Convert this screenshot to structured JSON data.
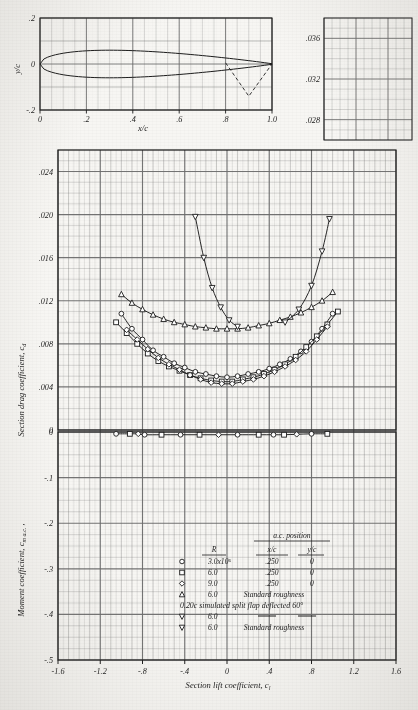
{
  "figure": {
    "style": "naca-airfoil-data-sheet",
    "paper_color": "#f7f6f3",
    "ink_color": "#1b1b1b",
    "grid_color": "#6d6d6d"
  },
  "profile_panel": {
    "name": "airfoil-section-profile",
    "xlabel": "x/c",
    "ylabel": "y/c",
    "xticks": [
      "0",
      ".2",
      ".4",
      ".6",
      ".8",
      "1.0"
    ],
    "xtick_values": [
      0,
      0.2,
      0.4,
      0.6,
      0.8,
      1.0
    ],
    "yticks": [
      ".2",
      "0",
      "-.2"
    ],
    "ytick_values": [
      0.2,
      0,
      -0.2
    ],
    "xlim": [
      0,
      1.0
    ],
    "ylim": [
      -0.2,
      0.2
    ],
    "thickness_ratio": 0.12,
    "flap_hinge_xc": 0.8,
    "flap_tip_xc": 0.9,
    "flap_tip_yc": -0.14
  },
  "corner_panel": {
    "name": "upper-right-grid-panel",
    "yticks": [
      ".036",
      ".032",
      ".028"
    ],
    "ytick_values": [
      0.036,
      0.032,
      0.028
    ]
  },
  "chart_data": {
    "type": "line",
    "title": "",
    "xlabel": "Section lift coefficient, c_l",
    "ylabel_top": "Section drag coefficient, c_d",
    "ylabel_bottom": "Moment coefficient, c_m a.c.",
    "xlim": [
      -1.6,
      1.6
    ],
    "xticks": [
      "-1.6",
      "-1.2",
      "-.8",
      "-.4",
      "0",
      ".4",
      ".8",
      "1.2",
      "1.6"
    ],
    "xtick_values": [
      -1.6,
      -1.2,
      -0.8,
      -0.4,
      0,
      0.4,
      0.8,
      1.2,
      1.6
    ],
    "drag_ylim": [
      0,
      0.026
    ],
    "drag_yticks": [
      ".024",
      ".020",
      ".016",
      ".012",
      ".008",
      ".004",
      "0"
    ],
    "drag_ytick_values": [
      0.024,
      0.02,
      0.016,
      0.012,
      0.008,
      0.004,
      0
    ],
    "moment_ylim": [
      -0.5,
      0.0
    ],
    "moment_yticks": [
      "0",
      "-.1",
      "-.2",
      "-.3",
      "-.4",
      "-.5"
    ],
    "moment_ytick_values": [
      0,
      -0.1,
      -0.2,
      -0.3,
      -0.4,
      -0.5
    ],
    "grid": true,
    "minor_step_x": 0.1,
    "minor_step_cd": 0.001,
    "minor_step_cm": 0.025,
    "series": [
      {
        "name": "R = 3.0x10^6 drag polar",
        "marker": "circle",
        "panel": "drag",
        "x": [
          -1.0,
          -0.9,
          -0.8,
          -0.7,
          -0.6,
          -0.5,
          -0.4,
          -0.3,
          -0.2,
          -0.1,
          0.0,
          0.1,
          0.2,
          0.3,
          0.4,
          0.5,
          0.6,
          0.7,
          0.8,
          0.9,
          1.0
        ],
        "values": [
          0.0108,
          0.0094,
          0.0084,
          0.0074,
          0.0068,
          0.0062,
          0.0058,
          0.0054,
          0.0052,
          0.005,
          0.0049,
          0.005,
          0.0052,
          0.0054,
          0.0057,
          0.0061,
          0.0066,
          0.0073,
          0.0082,
          0.0094,
          0.0108
        ]
      },
      {
        "name": "R = 6.0x10^6 drag polar",
        "marker": "square",
        "panel": "drag",
        "x": [
          -1.05,
          -0.95,
          -0.85,
          -0.75,
          -0.65,
          -0.55,
          -0.45,
          -0.35,
          -0.25,
          -0.15,
          -0.05,
          0.05,
          0.15,
          0.25,
          0.35,
          0.45,
          0.55,
          0.65,
          0.75,
          0.85,
          0.95,
          1.05
        ],
        "values": [
          0.01,
          0.009,
          0.008,
          0.0071,
          0.0064,
          0.0059,
          0.0055,
          0.0051,
          0.0048,
          0.0046,
          0.0045,
          0.0045,
          0.0047,
          0.0049,
          0.0052,
          0.0056,
          0.0061,
          0.0068,
          0.0077,
          0.0087,
          0.0098,
          0.011
        ]
      },
      {
        "name": "R = 9.0x10^6 drag polar",
        "marker": "diamond",
        "panel": "drag",
        "x": [
          -0.95,
          -0.85,
          -0.75,
          -0.65,
          -0.55,
          -0.45,
          -0.35,
          -0.25,
          -0.15,
          -0.05,
          0.05,
          0.15,
          0.25,
          0.35,
          0.45,
          0.55,
          0.65,
          0.75,
          0.85,
          0.95
        ],
        "values": [
          0.0093,
          0.0084,
          0.0075,
          0.0067,
          0.0061,
          0.0056,
          0.0051,
          0.0047,
          0.0044,
          0.0043,
          0.0043,
          0.0045,
          0.0047,
          0.005,
          0.0054,
          0.0059,
          0.0065,
          0.0073,
          0.0084,
          0.0096
        ]
      },
      {
        "name": "R = 6.0x10^6 standard roughness drag polar",
        "marker": "triangle",
        "panel": "drag",
        "x": [
          -1.0,
          -0.9,
          -0.8,
          -0.7,
          -0.6,
          -0.5,
          -0.4,
          -0.3,
          -0.2,
          -0.1,
          0.0,
          0.1,
          0.2,
          0.3,
          0.4,
          0.5,
          0.6,
          0.7,
          0.8,
          0.9,
          1.0
        ],
        "values": [
          0.0126,
          0.0118,
          0.0112,
          0.0107,
          0.0103,
          0.01,
          0.0098,
          0.0096,
          0.0095,
          0.0094,
          0.0094,
          0.0094,
          0.0095,
          0.0097,
          0.0099,
          0.0102,
          0.0105,
          0.0109,
          0.0114,
          0.012,
          0.0128
        ]
      },
      {
        "name": "split flap R = 6.0x10^6 left branch",
        "marker": "triangle-down",
        "panel": "drag",
        "x": [
          -0.3,
          -0.22,
          -0.14,
          -0.06,
          0.02,
          0.1
        ],
        "values": [
          0.0198,
          0.016,
          0.0132,
          0.0114,
          0.0102,
          0.0096
        ]
      },
      {
        "name": "split flap R = 6.0x10^6 right branch",
        "marker": "triangle-down",
        "panel": "drag",
        "x": [
          0.55,
          0.68,
          0.8,
          0.9,
          0.97
        ],
        "values": [
          0.01,
          0.0112,
          0.0134,
          0.0166,
          0.0196
        ]
      },
      {
        "name": "moment coefficient about aerodynamic center",
        "marker": "mixed",
        "panel": "moment",
        "x": [
          -1.05,
          -0.92,
          -0.84,
          -0.78,
          -0.62,
          -0.44,
          -0.26,
          -0.08,
          0.1,
          0.3,
          0.44,
          0.54,
          0.66,
          0.8,
          0.95
        ],
        "values": [
          -0.004,
          -0.004,
          -0.004,
          -0.006,
          -0.006,
          -0.006,
          -0.006,
          -0.006,
          -0.006,
          -0.006,
          -0.006,
          -0.006,
          -0.005,
          -0.004,
          -0.004
        ]
      }
    ]
  },
  "legend": {
    "header_ac": "a.c. position",
    "col_r": "R",
    "col_xc": "x/c",
    "col_yc": "y/c",
    "rows": [
      {
        "marker": "circle",
        "r": "3.0x10⁶",
        "xc": ".250",
        "yc": "0"
      },
      {
        "marker": "square",
        "r": "6.0",
        "xc": ".250",
        "yc": "0"
      },
      {
        "marker": "diamond",
        "r": "9.0",
        "xc": ".250",
        "yc": "0"
      },
      {
        "marker": "triangle",
        "r": "6.0",
        "note": "Standard roughness"
      }
    ],
    "flap_note": "0.20c simulated split flap deflected 60°",
    "flap_rows": [
      {
        "marker": "triangle-down",
        "r": "6.0",
        "dash": true
      },
      {
        "marker": "triangle-down",
        "r": "6.0",
        "note": "Standard roughness"
      }
    ]
  }
}
